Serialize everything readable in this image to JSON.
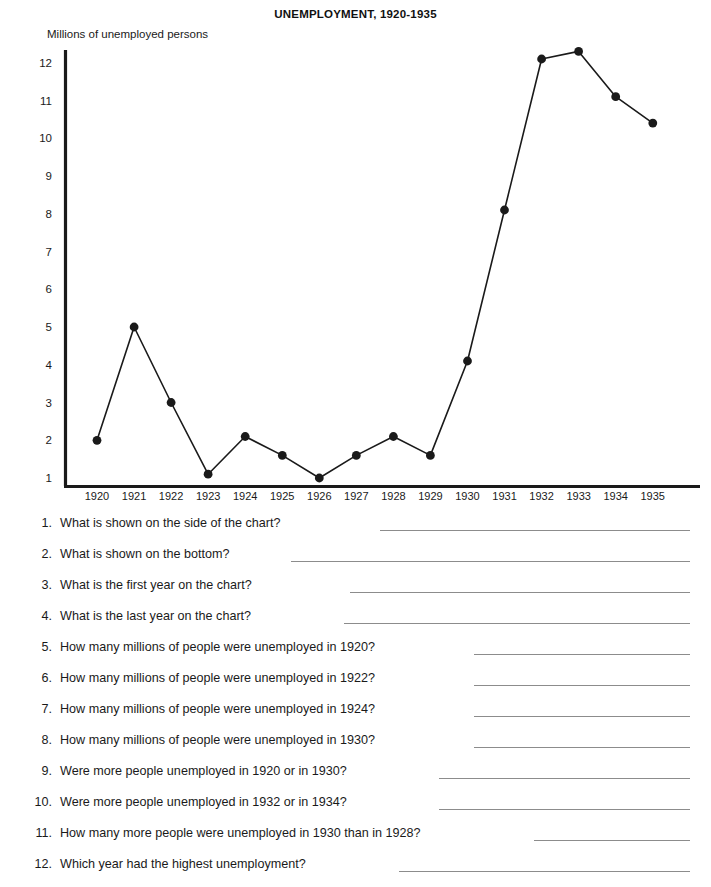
{
  "chart": {
    "title": "UNEMPLOYMENT, 1920-1935",
    "y_axis_caption": "Millions of unemployed persons"
  },
  "chart_data": {
    "type": "line",
    "title": "UNEMPLOYMENT, 1920-1935",
    "xlabel": "",
    "ylabel": "Millions of unemployed persons",
    "categories": [
      "1920",
      "1921",
      "1922",
      "1923",
      "1924",
      "1925",
      "1926",
      "1927",
      "1928",
      "1929",
      "1930",
      "1931",
      "1932",
      "1933",
      "1934",
      "1935"
    ],
    "values": [
      2.0,
      5.0,
      3.0,
      1.1,
      2.1,
      1.6,
      1.0,
      1.6,
      2.1,
      1.6,
      4.1,
      8.1,
      12.1,
      12.3,
      11.1,
      10.4
    ],
    "ylim": [
      0,
      12.6
    ],
    "yticks": [
      1,
      2,
      3,
      4,
      5,
      6,
      7,
      8,
      9,
      10,
      11,
      12
    ],
    "ytick_labels": [
      "1",
      "2",
      "3",
      "4",
      "5",
      "6",
      "7",
      "8",
      "9",
      "10",
      "11",
      "12"
    ],
    "grid": false,
    "legend": "none",
    "marker": "filled-circle",
    "line_color": "#1a1a1a",
    "marker_color": "#1a1a1a"
  },
  "questions": [
    {
      "number": "1.",
      "text": "What is shown on the side of the chart?",
      "line_width": 310
    },
    {
      "number": "2.",
      "text": "What is shown on the bottom?",
      "line_width": 399
    },
    {
      "number": "3.",
      "text": "What is the first year on the chart?",
      "line_width": 340
    },
    {
      "number": "4.",
      "text": "What is the last year on the chart?",
      "line_width": 346
    },
    {
      "number": "5.",
      "text": "How many millions of people were unemployed in 1920?",
      "line_width": 216
    },
    {
      "number": "6.",
      "text": "How many millions of people were unemployed in 1922?",
      "line_width": 216
    },
    {
      "number": "7.",
      "text": "How many millions of people were unemployed in 1924?",
      "line_width": 216
    },
    {
      "number": "8.",
      "text": "How many millions of people were unemployed in 1930?",
      "line_width": 216
    },
    {
      "number": "9.",
      "text": "Were more people unemployed in 1920 or in 1930?",
      "line_width": 251
    },
    {
      "number": "10.",
      "text": "Were more people unemployed in 1932 or in 1934?",
      "line_width": 251
    },
    {
      "number": "11.",
      "text": "How many more people were unemployed in 1930 than in 1928?",
      "line_width": 156
    },
    {
      "number": "12.",
      "text": "Which year had the highest unemployment?",
      "line_width": 291
    }
  ]
}
